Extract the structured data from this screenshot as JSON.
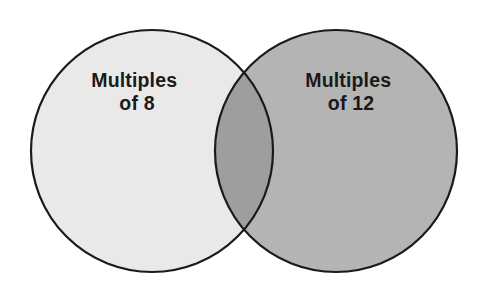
{
  "diagram": {
    "type": "venn-two-set",
    "background_color": "#ffffff",
    "stroke_color": "#1a1a1a",
    "stroke_width": 2.2,
    "canvas": {
      "width": 485,
      "height": 286
    },
    "sets": [
      {
        "id": "left-set",
        "label_line_1": "Multiples",
        "label_line_2": "of 8",
        "fill_color": "#e9e9e9",
        "center_x": 152,
        "center_y": 151,
        "radius": 121,
        "label_x": 137,
        "label_y_line_1": 87,
        "label_y_line_2": 110
      },
      {
        "id": "right-set",
        "label_line_1": "Multiples",
        "label_line_2": "of 12",
        "fill_color": "#b4b4b4",
        "center_x": 336,
        "center_y": 151,
        "radius": 121,
        "label_x": 351,
        "label_y_line_1": 87,
        "label_y_line_2": 110
      }
    ],
    "intersection": {
      "id": "intersection-region",
      "fill_color": "#9e9e9e",
      "label": "",
      "top_point_x": 245,
      "top_point_y": 58,
      "bottom_point_x": 245,
      "bottom_point_y": 243
    }
  }
}
